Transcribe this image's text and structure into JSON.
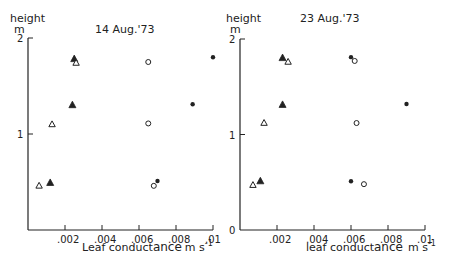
{
  "chart_data": [
    {
      "type": "scatter",
      "title": "14 Aug.'73",
      "xlabel": "Leaf conductance m s⁻¹",
      "ylabel": "height",
      "ylabel_unit": "m",
      "xlim": [
        0,
        0.01
      ],
      "ylim": [
        0,
        2
      ],
      "xticks": [
        ".002",
        ".004",
        ".006",
        ".008",
        ".01"
      ],
      "xtick_values": [
        0.002,
        0.004,
        0.006,
        0.008,
        0.01
      ],
      "yticks": [
        "1",
        "2"
      ],
      "ytick_values": [
        1,
        2
      ],
      "grid": false,
      "legend": null,
      "series": [
        {
          "name": "filled-triangle",
          "marker": "triangle-filled",
          "points": [
            [
              0.0025,
              1.78
            ],
            [
              0.0024,
              1.3
            ],
            [
              0.0012,
              0.49
            ]
          ]
        },
        {
          "name": "open-triangle",
          "marker": "triangle-open",
          "points": [
            [
              0.0026,
              1.74
            ],
            [
              0.0013,
              1.1
            ],
            [
              0.0006,
              0.46
            ]
          ]
        },
        {
          "name": "open-circle",
          "marker": "circle-open",
          "points": [
            [
              0.0065,
              1.75
            ],
            [
              0.0065,
              1.11
            ],
            [
              0.0068,
              0.46
            ]
          ]
        },
        {
          "name": "filled-circle",
          "marker": "circle-filled",
          "points": [
            [
              0.01,
              1.8
            ],
            [
              0.0089,
              1.31
            ],
            [
              0.007,
              0.51
            ]
          ]
        }
      ]
    },
    {
      "type": "scatter",
      "title": "23 Aug.'73",
      "xlabel": "leaf conductance m s⁻¹",
      "ylabel": "height",
      "ylabel_unit": "m",
      "xlim": [
        0,
        0.01
      ],
      "ylim": [
        0,
        2
      ],
      "xticks": [
        ".002",
        ".004",
        ".006",
        ".008",
        ".01"
      ],
      "xtick_values": [
        0.002,
        0.004,
        0.006,
        0.008,
        0.01
      ],
      "yticks": [
        "0",
        "1",
        "2"
      ],
      "ytick_values": [
        0,
        1,
        2
      ],
      "grid": false,
      "legend": null,
      "series": [
        {
          "name": "filled-triangle",
          "marker": "triangle-filled",
          "points": [
            [
              0.0023,
              1.8
            ],
            [
              0.0023,
              1.31
            ],
            [
              0.0011,
              0.51
            ]
          ]
        },
        {
          "name": "open-triangle",
          "marker": "triangle-open",
          "points": [
            [
              0.0026,
              1.76
            ],
            [
              0.0013,
              1.12
            ],
            [
              0.0007,
              0.47
            ]
          ]
        },
        {
          "name": "open-circle",
          "marker": "circle-open",
          "points": [
            [
              0.0062,
              1.77
            ],
            [
              0.0063,
              1.12
            ],
            [
              0.0067,
              0.48
            ]
          ]
        },
        {
          "name": "filled-circle",
          "marker": "circle-filled",
          "points": [
            [
              0.006,
              1.81
            ],
            [
              0.009,
              1.32
            ],
            [
              0.006,
              0.51
            ]
          ]
        }
      ]
    }
  ],
  "panels": [
    {
      "title": "14 Aug.'73",
      "ylabel": "height",
      "yunit": "m",
      "xlabel_main": "Leaf conduct",
      "xlabel_tail": "ance",
      "xlabel_unit": "m s",
      "xlabel_exp": "-1"
    },
    {
      "title": "23 Aug.'73",
      "ylabel": "height",
      "yunit": "m",
      "xlabel_main": "leaf conduct",
      "xlabel_tail": "ance",
      "xlabel_unit": "m s",
      "xlabel_exp": "-1"
    }
  ],
  "colors": {
    "ink": "#222222",
    "background": "#ffffff"
  }
}
